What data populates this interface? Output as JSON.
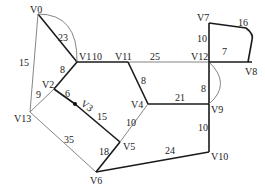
{
  "graph": {
    "vertices": [
      {
        "id": "V0",
        "x": 38,
        "y": 14,
        "lx": 30,
        "ly": 13
      },
      {
        "id": "V1",
        "x": 77,
        "y": 62,
        "lx": 79,
        "ly": 60
      },
      {
        "id": "V2",
        "x": 54,
        "y": 89,
        "lx": 42,
        "ly": 88
      },
      {
        "id": "V3",
        "x": 75,
        "y": 104,
        "lx": 80,
        "ly": 105
      },
      {
        "id": "V13",
        "x": 30,
        "y": 112,
        "lx": 14,
        "ly": 122
      },
      {
        "id": "V4",
        "x": 148,
        "y": 104,
        "lx": 131,
        "ly": 108
      },
      {
        "id": "V5",
        "x": 120,
        "y": 142,
        "lx": 123,
        "ly": 150
      },
      {
        "id": "V6",
        "x": 96,
        "y": 172,
        "lx": 90,
        "ly": 184
      },
      {
        "id": "V11",
        "x": 128,
        "y": 62,
        "lx": 115,
        "ly": 60
      },
      {
        "id": "V12",
        "x": 209,
        "y": 62,
        "lx": 191,
        "ly": 60
      },
      {
        "id": "V7",
        "x": 209,
        "y": 23,
        "lx": 197,
        "ly": 21
      },
      {
        "id": "V8",
        "x": 252,
        "y": 62,
        "lx": 245,
        "ly": 75
      },
      {
        "id": "V9",
        "x": 209,
        "y": 104,
        "lx": 211,
        "ly": 113
      },
      {
        "id": "V10",
        "x": 209,
        "y": 152,
        "lx": 211,
        "ly": 160
      }
    ],
    "edges": [
      {
        "from": "V0",
        "to": "V1",
        "w": "23",
        "bold": true,
        "lx": 58,
        "ly": 41
      },
      {
        "from": "V0",
        "to": "V1",
        "w": "",
        "curve": "M38 14 Q78 14 77 62",
        "bold": false
      },
      {
        "from": "V0",
        "to": "V13",
        "w": "15",
        "bold": false,
        "lx": 19,
        "ly": 66
      },
      {
        "from": "V1",
        "to": "V2",
        "w": "8",
        "bold": true,
        "lx": 60,
        "ly": 73
      },
      {
        "from": "V2",
        "to": "V13",
        "w": "9",
        "bold": false,
        "lx": 36,
        "ly": 98
      },
      {
        "from": "V2",
        "to": "V3",
        "w": "6",
        "bold": true,
        "lx": 65,
        "ly": 97
      },
      {
        "from": "V3",
        "to": "V5",
        "w": "15",
        "bold": true,
        "lx": 97,
        "ly": 120
      },
      {
        "from": "V13",
        "to": "V6",
        "w": "35",
        "bold": false,
        "lx": 64,
        "ly": 143
      },
      {
        "from": "V5",
        "to": "V6",
        "w": "18",
        "bold": true,
        "lx": 99,
        "ly": 155
      },
      {
        "from": "V1",
        "to": "V11",
        "w": "10",
        "bold": true,
        "lx": 92,
        "ly": 60
      },
      {
        "from": "V11",
        "to": "V12",
        "w": "25",
        "bold": false,
        "lx": 150,
        "ly": 60
      },
      {
        "from": "V11",
        "to": "V4",
        "w": "8",
        "bold": true,
        "lx": 141,
        "ly": 84
      },
      {
        "from": "V4",
        "to": "V5",
        "w": "10",
        "bold": false,
        "lx": 126,
        "ly": 126
      },
      {
        "from": "V4",
        "to": "V9",
        "w": "21",
        "bold": true,
        "lx": 175,
        "ly": 101
      },
      {
        "from": "V12",
        "to": "V9",
        "w": "8",
        "bold": true,
        "lx": 201,
        "ly": 92
      },
      {
        "from": "V12",
        "to": "V9",
        "w": "",
        "curve": "M209 62 Q232 84 209 104",
        "bold": false
      },
      {
        "from": "V12",
        "to": "V7",
        "w": "10",
        "bold": true,
        "lx": 197,
        "ly": 42
      },
      {
        "from": "V12",
        "to": "V8",
        "w": "7",
        "bold": true,
        "lx": 222,
        "ly": 55
      },
      {
        "from": "V7",
        "to": "V8",
        "w": "16",
        "bold": true,
        "curve": "M209 23 L246 28 Q254 34 252 40 L248 62",
        "lx": 238,
        "ly": 26
      },
      {
        "from": "V9",
        "to": "V10",
        "w": "10",
        "bold": true,
        "lx": 198,
        "ly": 131
      },
      {
        "from": "V6",
        "to": "V10",
        "w": "24",
        "bold": true,
        "lx": 165,
        "ly": 154
      }
    ]
  }
}
